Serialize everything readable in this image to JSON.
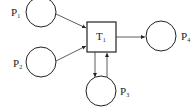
{
  "diagram": {
    "type": "petri-net",
    "places": [
      {
        "id": "P1",
        "label": "P",
        "sub": "1"
      },
      {
        "id": "P2",
        "label": "P",
        "sub": "2"
      },
      {
        "id": "P3",
        "label": "P",
        "sub": "3"
      },
      {
        "id": "P4",
        "label": "P",
        "sub": "4"
      }
    ],
    "transitions": [
      {
        "id": "T1",
        "label": "T",
        "sub": "1"
      }
    ],
    "arcs": [
      {
        "from": "P1",
        "to": "T1"
      },
      {
        "from": "P2",
        "to": "T1"
      },
      {
        "from": "T1",
        "to": "P4"
      },
      {
        "from": "T1",
        "to": "P3"
      },
      {
        "from": "P3",
        "to": "T1"
      }
    ],
    "colors": {
      "stroke": "#222222",
      "background": "#ffffff"
    }
  }
}
